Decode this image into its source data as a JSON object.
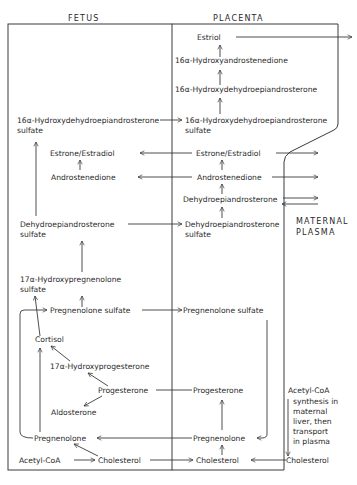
{
  "headers": {
    "fetus": "FETUS",
    "placenta": "PLACENTA",
    "maternal_plasma_line1": "MATERNAL",
    "maternal_plasma_line2": "PLASMA"
  },
  "placenta": {
    "estriol": "Estriol",
    "oh_androstenedione": "16α-Hydroxyandrostenedione",
    "oh_dhea": "16α-Hydroxydehydroepiandrosterone",
    "oh_dhea_sulfate_1": "16α-Hydroxydehydroepiandrosterone",
    "oh_dhea_sulfate_2": "sulfate",
    "estrone_estradiol": "Estrone/Estradiol",
    "androstenedione": "Androstenedione",
    "dhea": "Dehydroepiandrosterone",
    "dhea_sulfate_1": "Dehydroepiandrosterone",
    "dhea_sulfate_2": "sulfate",
    "pregnenolone_sulfate": "Pregnenolone sulfate",
    "progesterone": "Progesterone",
    "pregnenolone": "Pregnenolone",
    "cholesterol": "Cholesterol"
  },
  "fetus": {
    "oh_dhea_sulfate_1": "16α-Hydroxydehydroepiandrosterone",
    "oh_dhea_sulfate_2": "sulfate",
    "estrone_estradiol": "Estrone/Estradiol",
    "androstenedione": "Androstenedione",
    "dhea_sulfate_1": "Dehydroepiandrosterone",
    "dhea_sulfate_2": "sulfate",
    "oh_pregnenolone_sulfate_1": "17α-Hydroxypregnenolone",
    "oh_pregnenolone_sulfate_2": "sulfate",
    "pregnenolone_sulfate": "Pregnenolone sulfate",
    "cortisol": "Cortisol",
    "oh_progesterone": "17α-Hydroxyprogesterone",
    "progesterone": "Progesterone",
    "aldosterone": "Aldosterone",
    "pregnenolone": "Pregnenolone",
    "acetyl_coa": "Acetyl-CoA",
    "cholesterol": "Cholesterol"
  },
  "maternal": {
    "acetyl_coa": "Acetyl-CoA",
    "note_1": "synthesis in",
    "note_2": "maternal",
    "note_3": "liver, then",
    "note_4": "transport",
    "note_5": "in plasma",
    "cholesterol": "Cholesterol"
  }
}
